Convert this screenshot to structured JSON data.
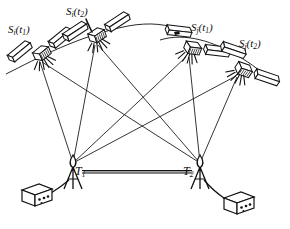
{
  "figure": {
    "type": "line-diagram",
    "background_color": "#ffffff",
    "ink_color": "#111111",
    "width": 290,
    "height": 229
  },
  "satellites": [
    {
      "id": "si-t1",
      "label_base": "S",
      "label_index": "i",
      "label_time": "t",
      "label_time_index": "1",
      "label_text": "Si(t1)",
      "x": 40,
      "y": 55,
      "body_angle": -24,
      "label_x": 8,
      "label_y": 24
    },
    {
      "id": "si-t2",
      "label_base": "S",
      "label_index": "i",
      "label_time": "t",
      "label_time_index": "2",
      "label_text": "Si(t2)",
      "x": 95,
      "y": 37,
      "body_angle": -18,
      "label_x": 66,
      "label_y": 6
    },
    {
      "id": "sj-t1",
      "label_base": "S",
      "label_index": "j",
      "label_time": "t",
      "label_time_index": "1",
      "label_text": "Sj(t1)",
      "x": 190,
      "y": 48,
      "body_angle": 22,
      "label_x": 191,
      "label_y": 22
    },
    {
      "id": "sj-t2",
      "label_base": "S",
      "label_index": "j",
      "label_time": "t",
      "label_time_index": "2",
      "label_text": "Sj(t2)",
      "x": 241,
      "y": 69,
      "body_angle": 34,
      "label_x": 239,
      "label_y": 38
    }
  ],
  "stations": [
    {
      "id": "t1",
      "label_base": "T",
      "label_index": "1",
      "label_text": "T1",
      "apex_x": 73,
      "apex_y": 163,
      "label_x": 75,
      "label_y": 165,
      "receiver_x": 43,
      "receiver_y": 196
    },
    {
      "id": "t2",
      "label_base": "T",
      "label_index": "2",
      "label_text": "T2",
      "apex_x": 200,
      "apex_y": 163,
      "label_x": 183,
      "label_y": 165,
      "receiver_x": 233,
      "receiver_y": 202
    }
  ],
  "baseline": {
    "name": "baseline",
    "from": "t1",
    "to": "t2",
    "x1": 82,
    "y1": 172,
    "x2": 192,
    "y2": 172,
    "style": "double-rule"
  },
  "sight_lines": [
    {
      "from": "si-t1",
      "to": "t1"
    },
    {
      "from": "si-t1",
      "to": "t2"
    },
    {
      "from": "si-t2",
      "to": "t1"
    },
    {
      "from": "si-t2",
      "to": "t2"
    },
    {
      "from": "sj-t1",
      "to": "t1"
    },
    {
      "from": "sj-t1",
      "to": "t2"
    },
    {
      "from": "sj-t2",
      "to": "t1"
    },
    {
      "from": "sj-t2",
      "to": "t2"
    }
  ],
  "orbit_arcs": [
    {
      "id": "orbit-i",
      "description": "orbital track through Si(t1) and Si(t2)"
    },
    {
      "id": "orbit-j",
      "description": "orbital track through Sj(t1) and Sj(t2)"
    }
  ],
  "marks": [
    {
      "id": "ink-speck",
      "x": 176,
      "y": 33
    }
  ]
}
